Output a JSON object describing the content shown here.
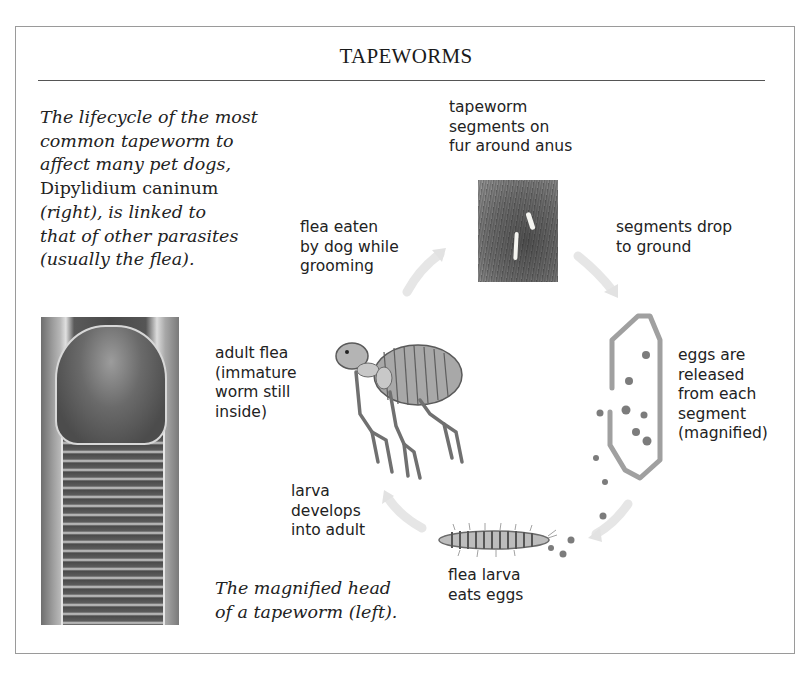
{
  "title": "TAPEWORMS",
  "intro": {
    "lines": [
      {
        "text": "The lifecycle of the most",
        "italic": true
      },
      {
        "text": "common tapeworm to",
        "italic": true
      },
      {
        "text": "affect many pet dogs,",
        "italic": true
      },
      {
        "text": "Dipylidium caninum",
        "italic": false
      },
      {
        "text": "(right), is linked to",
        "italic": true
      },
      {
        "text": "that of other parasites",
        "italic": true
      },
      {
        "text": "(usually the flea).",
        "italic": true
      }
    ]
  },
  "caption": {
    "lines": [
      "The magnified head",
      "of a tapeworm (left)."
    ]
  },
  "lifecycle": {
    "stages": [
      {
        "id": "segments-on-fur",
        "lines": [
          "tapeworm",
          "segments on",
          "fur around anus"
        ]
      },
      {
        "id": "segments-drop",
        "lines": [
          "segments drop",
          "to ground"
        ]
      },
      {
        "id": "eggs-released",
        "lines": [
          "eggs are",
          "released",
          "from each",
          "segment",
          "(magnified)"
        ]
      },
      {
        "id": "larva-eats-eggs",
        "lines": [
          "flea larva",
          "eats eggs"
        ]
      },
      {
        "id": "larva-develops",
        "lines": [
          "larva",
          "develops",
          "into adult"
        ]
      },
      {
        "id": "adult-flea",
        "lines": [
          "adult flea",
          "(immature",
          "worm still",
          "inside)"
        ]
      },
      {
        "id": "flea-eaten",
        "lines": [
          "flea eaten",
          "by dog while",
          "grooming"
        ]
      }
    ]
  },
  "colors": {
    "frame": "#9a9a9a",
    "rule": "#555555",
    "text": "#222222",
    "arrow": "#e4e4e4",
    "egg": "#7a7a7a",
    "segment_outline": "#9c9c9c"
  }
}
